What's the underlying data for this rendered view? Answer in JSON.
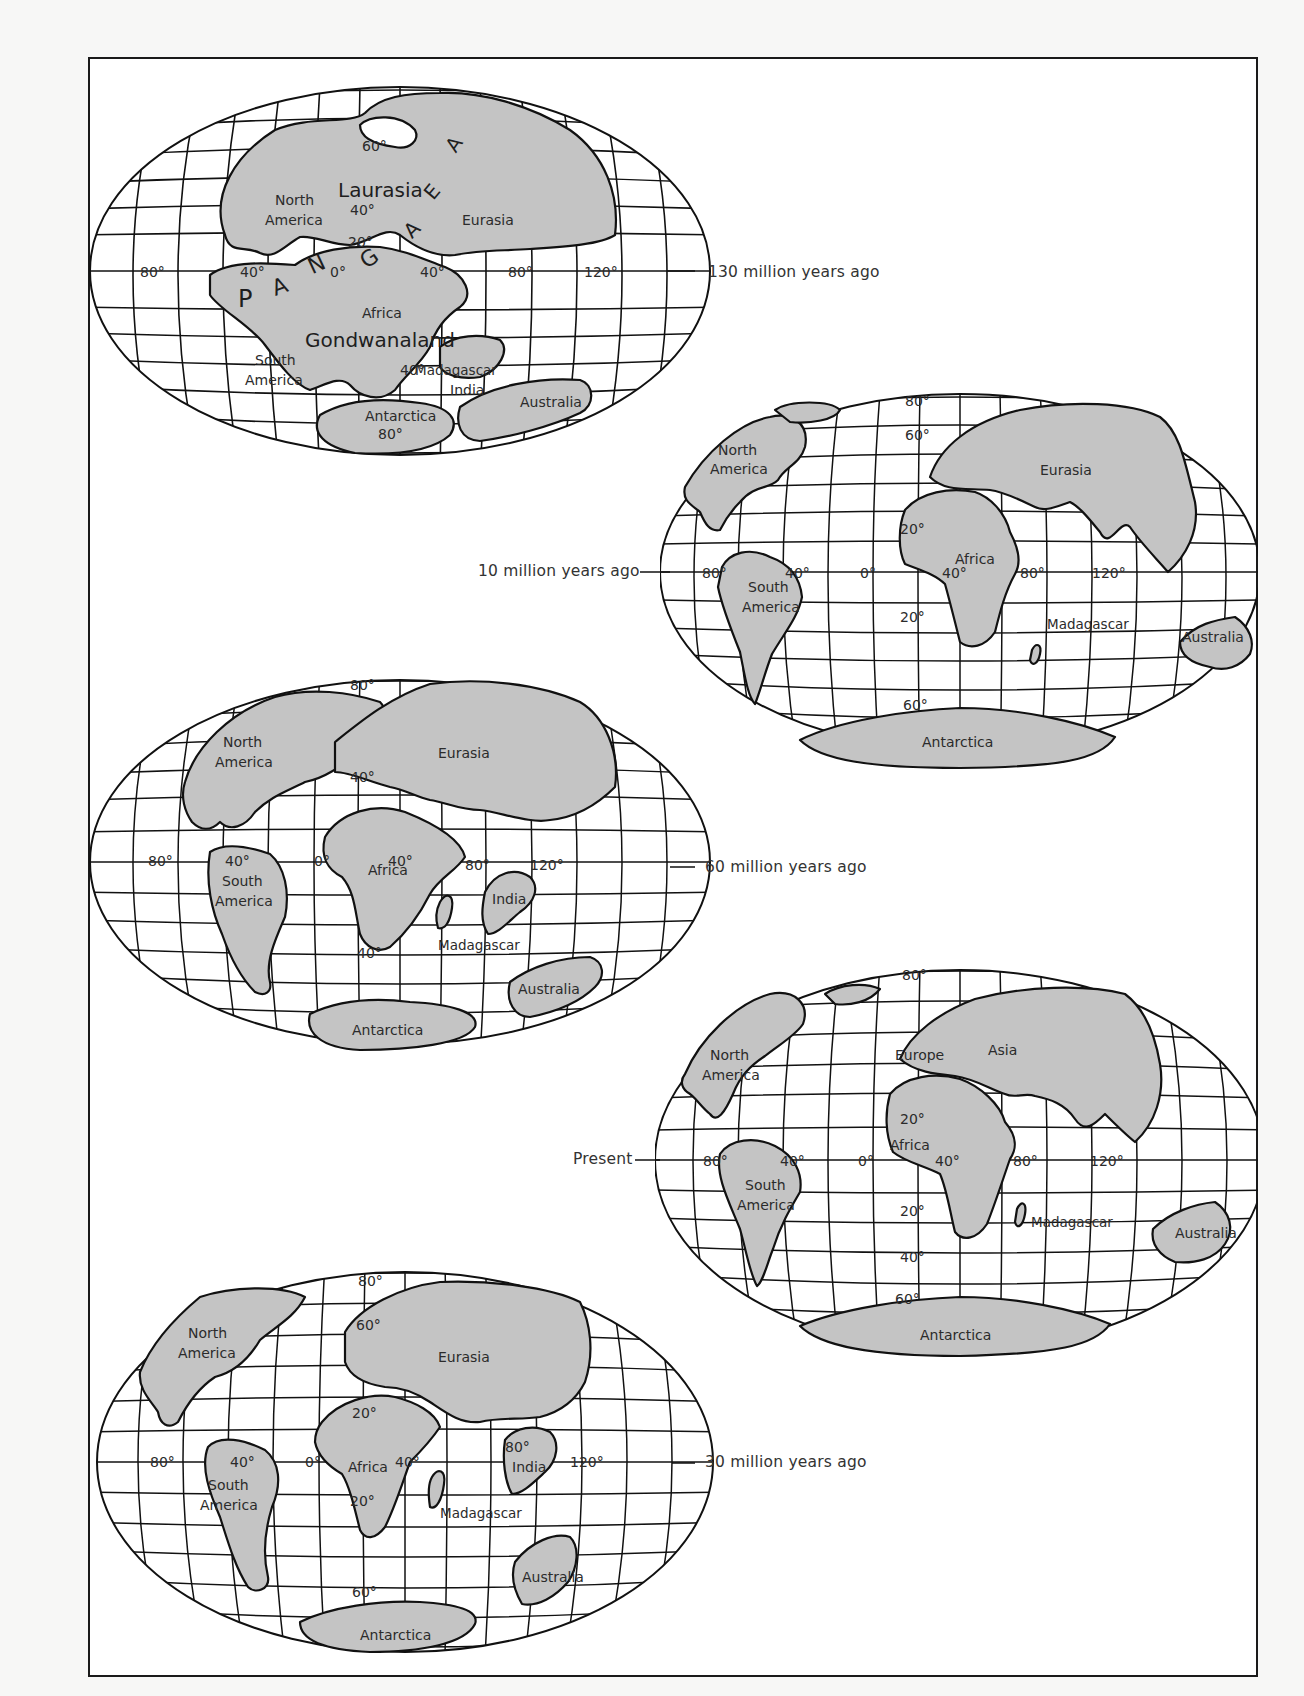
{
  "figure": {
    "land_color": "#c4c4c4",
    "line_color": "#111111",
    "background": "#ffffff"
  },
  "maps": [
    {
      "id": "130mya",
      "era_label": "130 million years ago",
      "continents": {
        "north_america": "North America",
        "north_america_l1": "North",
        "north_america_l2": "America",
        "laurasia": "Laurasia",
        "eurasia": "Eurasia",
        "africa": "Africa",
        "gondwanaland": "Gondwanaland",
        "south_america_l1": "South",
        "south_america_l2": "America",
        "madagascar": "Madagascar",
        "india": "India",
        "antarctica": "Antarctica",
        "australia": "Australia"
      },
      "pangaea_letters": [
        "P",
        "A",
        "N",
        "G",
        "A",
        "E",
        "A"
      ],
      "degree_labels": {
        "lat_60": "60°",
        "lat_40n": "40°",
        "lat_20n": "20°",
        "lon_0": "0°",
        "lon_40w": "40°",
        "lon_40e": "40°",
        "lon_80w": "80°",
        "lon_80e": "80°",
        "lon_120e": "120°",
        "lat_40s": "40°",
        "lat_80s": "80°"
      }
    },
    {
      "id": "10mya",
      "era_label": "10 million years ago",
      "continents": {
        "north_america_l1": "North",
        "north_america_l2": "America",
        "eurasia": "Eurasia",
        "africa": "Africa",
        "south_america_l1": "South",
        "south_america_l2": "America",
        "madagascar": "Madagascar",
        "australia": "Australia",
        "antarctica": "Antarctica"
      },
      "degree_labels": {
        "lat_80n": "80°",
        "lat_60n": "60°",
        "lat_20n": "20°",
        "lat_20s": "20°",
        "lat_60s": "60°",
        "lon_80w": "80°",
        "lon_40w": "40°",
        "lon_0": "0°",
        "lon_40e": "40°",
        "lon_80e": "80°",
        "lon_120e": "120°"
      }
    },
    {
      "id": "60mya",
      "era_label": "60 million years ago",
      "continents": {
        "north_america_l1": "North",
        "north_america_l2": "America",
        "eurasia": "Eurasia",
        "africa": "Africa",
        "south_america_l1": "South",
        "south_america_l2": "America",
        "india": "India",
        "madagascar": "Madagascar",
        "australia": "Australia",
        "antarctica": "Antarctica"
      },
      "degree_labels": {
        "lat_80n": "80°",
        "lat_40n": "40°",
        "lat_40s": "40°",
        "lon_80w": "80°",
        "lon_40w": "40°",
        "lon_0": "0°",
        "lon_40e": "40°",
        "lon_80e": "80°",
        "lon_120e": "120°"
      }
    },
    {
      "id": "present",
      "era_label": "Present",
      "continents": {
        "north_america_l1": "North",
        "north_america_l2": "America",
        "europe": "Europe",
        "asia": "Asia",
        "africa": "Africa",
        "south_america_l1": "South",
        "south_america_l2": "America",
        "madagascar": "Madagascar",
        "australia": "Australia",
        "antarctica": "Antarctica"
      },
      "degree_labels": {
        "lat_80n": "80°",
        "lat_20n": "20°",
        "lat_20s": "20°",
        "lat_40s": "40°",
        "lat_60s": "60°",
        "lon_80w": "80°",
        "lon_40w": "40°",
        "lon_0": "0°",
        "lon_40e": "40°",
        "lon_80e": "80°",
        "lon_120e": "120°"
      }
    },
    {
      "id": "30mya",
      "era_label": "30 million years ago",
      "continents": {
        "north_america_l1": "North",
        "north_america_l2": "America",
        "eurasia": "Eurasia",
        "africa": "Africa",
        "south_america_l1": "South",
        "south_america_l2": "America",
        "india": "India",
        "madagascar": "Madagascar",
        "australia": "Australia",
        "antarctica": "Antarctica"
      },
      "degree_labels": {
        "lat_80n": "80°",
        "lat_60n": "60°",
        "lat_20n": "20°",
        "lat_20s": "20°",
        "lat_60s": "60°",
        "lon_80w": "80°",
        "lon_40w": "40°",
        "lon_0": "0°",
        "lon_40e": "40°",
        "lon_80e": "80°",
        "lon_120e": "120°"
      }
    }
  ]
}
